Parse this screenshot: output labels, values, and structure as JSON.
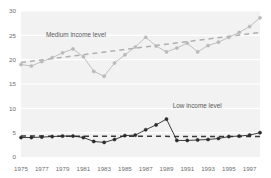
{
  "caption": {
    "text": "",
    "visible_note": ""
  },
  "chart_data": {
    "type": "line",
    "title": "",
    "subtitle": "",
    "xlabel": "",
    "ylabel": "",
    "xlim": [
      1975,
      1998
    ],
    "ylim": [
      0,
      30
    ],
    "grid": true,
    "grid_axis": "y",
    "legend": "annotation-labels",
    "y_ticks": [
      "0",
      "5",
      "10",
      "15",
      "20",
      "25",
      "30"
    ],
    "y_tick_values": [
      0,
      5,
      10,
      15,
      20,
      25,
      30
    ],
    "x_ticks": [
      "1975",
      "1977",
      "1979",
      "1981",
      "1983",
      "1985",
      "1987",
      "1989",
      "1991",
      "1993",
      "1995",
      "1997"
    ],
    "x_tick_values": [
      1975,
      1977,
      1979,
      1981,
      1983,
      1985,
      1987,
      1989,
      1991,
      1993,
      1995,
      1997
    ],
    "x": [
      1975,
      1976,
      1977,
      1978,
      1979,
      1980,
      1981,
      1982,
      1983,
      1984,
      1985,
      1986,
      1987,
      1988,
      1989,
      1990,
      1991,
      1992,
      1993,
      1994,
      1995,
      1996,
      1997,
      1998
    ],
    "series": [
      {
        "name": "Medium income level",
        "color": "#b9b9b9",
        "marker": "circle",
        "label_x": 1977.4,
        "label_y": 24.6,
        "values": [
          19.0,
          18.7,
          19.6,
          20.4,
          21.4,
          22.2,
          20.6,
          17.6,
          16.6,
          19.3,
          21.0,
          22.6,
          24.6,
          22.8,
          21.6,
          22.4,
          23.4,
          21.6,
          22.9,
          23.6,
          24.6,
          25.6,
          26.8,
          28.6
        ],
        "trend": {
          "name": "medium-trend",
          "style": "dashed",
          "color": "#b0b0b0",
          "start": {
            "x": 1975,
            "y": 19.4
          },
          "end": {
            "x": 1998,
            "y": 25.6
          }
        }
      },
      {
        "name": "Low income level",
        "color": "#2b2b2b",
        "marker": "circle",
        "label_x": 1989.6,
        "label_y": 10.1,
        "values": [
          4.0,
          4.0,
          4.1,
          4.2,
          4.3,
          4.3,
          4.0,
          3.2,
          3.0,
          3.6,
          4.4,
          4.5,
          5.6,
          6.6,
          7.8,
          3.4,
          3.4,
          3.5,
          3.6,
          3.8,
          4.2,
          4.3,
          4.5,
          5.0
        ],
        "trend": {
          "name": "low-trend",
          "style": "dashed",
          "color": "#3a3a3a",
          "start": {
            "x": 1975,
            "y": 4.3
          },
          "end": {
            "x": 1998,
            "y": 4.2
          }
        }
      }
    ]
  }
}
